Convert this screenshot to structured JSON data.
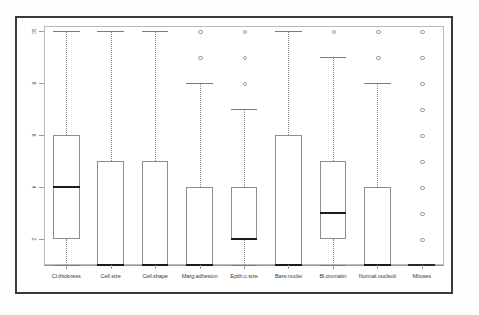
{
  "figure": {
    "kind": "boxplot-figure",
    "background": "#ffffff",
    "frame_color": "#3a3a3a",
    "plot_border_color": "#b9b9b9",
    "box_color": "#8e8e8e",
    "median_color": "#1c1c1c",
    "whisker_color": "#8a8a8a",
    "outlier_color": "#9d9d9d"
  },
  "chart_data": {
    "type": "box",
    "title": "",
    "xlabel": "",
    "ylabel": "",
    "ylim": [
      1,
      10
    ],
    "grid": false,
    "legend": null,
    "yticks": [
      2,
      4,
      6,
      8,
      10
    ],
    "ytick_labels": [
      "2",
      "4",
      "6",
      "8",
      "10"
    ],
    "categories": [
      "Cl.thickness",
      "Cell.size",
      "Cell.shape",
      "Marg.adhesion",
      "Epith.c.size",
      "Bare.nuclei",
      "Bl.cromatin",
      "Normal.nucleoli",
      "Mitoses"
    ],
    "boxes": [
      {
        "name": "Cl.thickness",
        "whisker_low": 1,
        "q1": 2,
        "median": 4,
        "q3": 6,
        "whisker_high": 10,
        "outliers": []
      },
      {
        "name": "Cell.size",
        "whisker_low": 1,
        "q1": 1,
        "median": 1,
        "q3": 5,
        "whisker_high": 10,
        "outliers": []
      },
      {
        "name": "Cell.shape",
        "whisker_low": 1,
        "q1": 1,
        "median": 1,
        "q3": 5,
        "whisker_high": 10,
        "outliers": []
      },
      {
        "name": "Marg.adhesion",
        "whisker_low": 1,
        "q1": 1,
        "median": 1,
        "q3": 4,
        "whisker_high": 8,
        "outliers": [
          9,
          10
        ]
      },
      {
        "name": "Epith.c.size",
        "whisker_low": 1,
        "q1": 2,
        "median": 2,
        "q3": 4,
        "whisker_high": 7,
        "outliers": [
          8,
          9,
          10
        ]
      },
      {
        "name": "Bare.nuclei",
        "whisker_low": 1,
        "q1": 1,
        "median": 1,
        "q3": 6,
        "whisker_high": 10,
        "outliers": []
      },
      {
        "name": "Bl.cromatin",
        "whisker_low": 1,
        "q1": 2,
        "median": 3,
        "q3": 5,
        "whisker_high": 9,
        "outliers": [
          10
        ]
      },
      {
        "name": "Normal.nucleoli",
        "whisker_low": 1,
        "q1": 1,
        "median": 1,
        "q3": 4,
        "whisker_high": 8,
        "outliers": [
          9,
          10
        ]
      },
      {
        "name": "Mitoses",
        "whisker_low": 1,
        "q1": 1,
        "median": 1,
        "q3": 1,
        "whisker_high": 1,
        "outliers": [
          2,
          3,
          4,
          5,
          6,
          7,
          8,
          9,
          10
        ]
      }
    ]
  }
}
